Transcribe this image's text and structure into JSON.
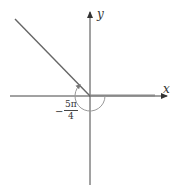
{
  "diagram": {
    "type": "angle-in-standard-position",
    "axes": {
      "x_label": "x",
      "y_label": "y"
    },
    "angle": {
      "label_sign": "−",
      "label_numerator": "5π",
      "label_denominator": "4",
      "value": "-5π/4",
      "direction": "clockwise"
    },
    "colors": {
      "axis": "#444444",
      "initial_side": "#888888",
      "terminal_side": "#666666",
      "arc": "#999999"
    }
  }
}
